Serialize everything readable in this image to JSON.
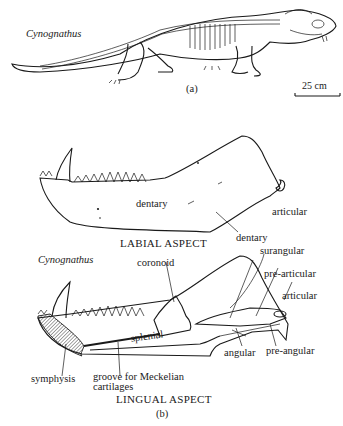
{
  "figure": {
    "panel_a": {
      "species_label": "Cynognathus",
      "panel_label": "(a)",
      "scale_bar": "25 cm"
    },
    "panel_b": {
      "species_label": "Cynognathus",
      "panel_label": "(b)",
      "labial": {
        "title": "LABIAL ASPECT",
        "labels": {
          "dentary": "dentary",
          "articular": "articular"
        }
      },
      "lingual": {
        "title": "LINGUAL ASPECT",
        "labels": {
          "dentary": "dentary",
          "surangular": "surangular",
          "coronoid": "coronoid",
          "pre_articular": "pre-articular",
          "articular": "articular",
          "splenial": "splenial",
          "angular": "angular",
          "pre_angular": "pre-angular",
          "symphysis": "symphysis",
          "groove_line1": "groove for Meckelian",
          "groove_line2": "cartilages"
        }
      }
    }
  }
}
